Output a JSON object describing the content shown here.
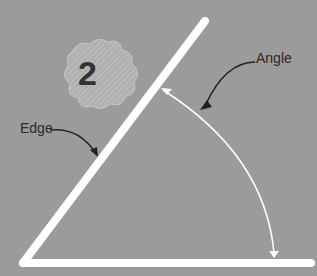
{
  "diagram": {
    "badge_number": "2",
    "labels": {
      "edge": "Edge",
      "angle": "Angle"
    },
    "colors": {
      "background": "#9b9b9b",
      "lines": "#ffffff",
      "text": "#2a2a2a",
      "badge": "#b4b4b4"
    }
  }
}
